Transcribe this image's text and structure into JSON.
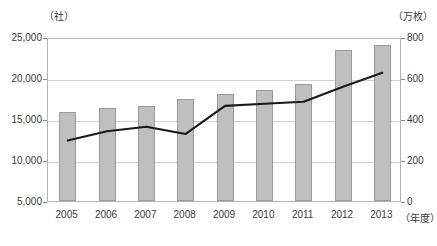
{
  "axes": {
    "left_unit": "（社）",
    "right_unit": "（万枚）",
    "x_unit": "（年度）",
    "left_ticks": [
      "25,000",
      "20,000",
      "15,000",
      "10,000",
      "5,000"
    ],
    "right_ticks": [
      "800",
      "600",
      "400",
      "200",
      "0"
    ]
  },
  "chart_data": {
    "type": "bar",
    "title": "",
    "xlabel": "（年度）",
    "ylabel": "（社）",
    "y2label": "（万枚）",
    "categories": [
      "2005",
      "2006",
      "2007",
      "2008",
      "2009",
      "2010",
      "2011",
      "2012",
      "2013"
    ],
    "ylim": [
      5000,
      25000
    ],
    "y2lim": [
      0,
      800
    ],
    "yticks": [
      5000,
      10000,
      15000,
      20000,
      25000
    ],
    "y2ticks": [
      0,
      200,
      400,
      600,
      800
    ],
    "grid": true,
    "legend": "none",
    "series": [
      {
        "name": "社数",
        "type": "bar",
        "axis": "left",
        "unit": "社",
        "color": "#bfbfbf",
        "values": [
          15900,
          16300,
          16600,
          17400,
          18000,
          18500,
          19300,
          23400,
          24000
        ]
      },
      {
        "name": "枚数",
        "type": "line",
        "axis": "right",
        "unit": "万枚",
        "color": "#1a1a1a",
        "values": [
          305,
          350,
          372,
          337,
          474,
          484,
          494,
          567,
          635
        ]
      }
    ]
  }
}
